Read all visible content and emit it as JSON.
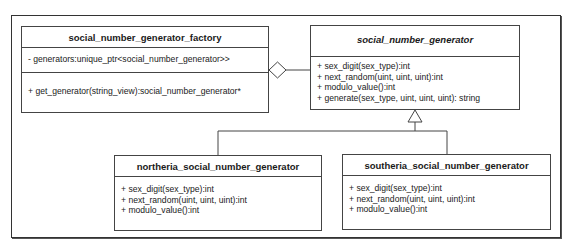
{
  "diagram": {
    "type": "uml-class-diagram",
    "classes": {
      "factory": {
        "name": "social_number_generator_factory",
        "abstract": false,
        "attributes": [
          "- generators:unique_ptr<social_number_generator>>"
        ],
        "operations": [
          "+ get_generator(string_view):social_number_generator*"
        ]
      },
      "base": {
        "name": "social_number_generator",
        "abstract": true,
        "operations": [
          "+ sex_digit(sex_type):int",
          "+ next_random(uint, uint, uint):int",
          "+ modulo_value():int",
          "+ generate(sex_type, uint, uint, uint): string"
        ]
      },
      "northeria": {
        "name": "northeria_social_number_generator",
        "abstract": false,
        "operations": [
          "+ sex_digit(sex_type):int",
          "+ next_random(uint, uint, uint):int",
          "+ modulo_value():int"
        ]
      },
      "southeria": {
        "name": "southeria_social_number_generator",
        "abstract": false,
        "operations": [
          "+ sex_digit(sex_type):int",
          "+ next_random(uint, uint, uint):int",
          "+ modulo_value():int"
        ]
      }
    },
    "relationships": [
      {
        "type": "aggregation",
        "from": "social_number_generator_factory",
        "to": "social_number_generator"
      },
      {
        "type": "generalization",
        "from": "northeria_social_number_generator",
        "to": "social_number_generator"
      },
      {
        "type": "generalization",
        "from": "southeria_social_number_generator",
        "to": "social_number_generator"
      }
    ],
    "colors": {
      "line": "#444444",
      "background": "#ffffff",
      "text": "#1a1a1a"
    }
  }
}
